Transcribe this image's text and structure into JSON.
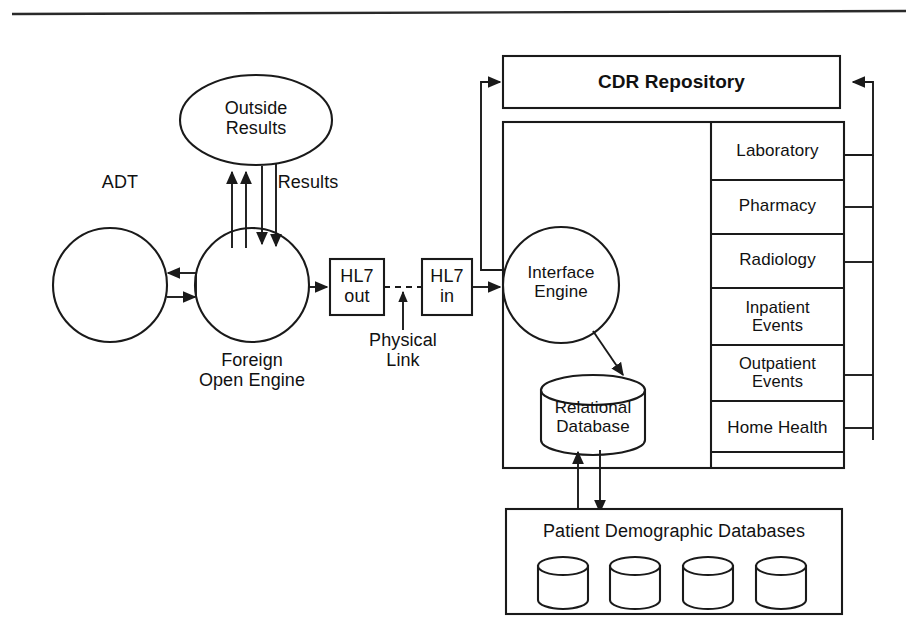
{
  "diagram": {
    "top_rule": "horizontal-rule"
  },
  "left_section": {
    "adt_label": "ADT",
    "results_label": "Results",
    "outside_results": "Outside\nResults",
    "foreign_open_engine": "Foreign\nOpen Engine",
    "source_circle": "",
    "engine_circle": ""
  },
  "link_section": {
    "hl7_out": "HL7\nout",
    "hl7_in": "HL7\nin",
    "physical_link": "Physical\nLink"
  },
  "cdr": {
    "repository_title": "CDR Repository",
    "interface_engine": "Interface\nEngine",
    "relational_database": "Relational\nDatabase",
    "departments": [
      {
        "label": "Laboratory",
        "has_rail_connector": true
      },
      {
        "label": "Pharmacy",
        "has_rail_connector": true
      },
      {
        "label": "Radiology",
        "has_rail_connector": true
      },
      {
        "label": "Inpatient\nEvents",
        "has_rail_connector": false
      },
      {
        "label": "Outpatient\nEvents",
        "has_rail_connector": true
      },
      {
        "label": "Home Health",
        "has_rail_connector": true
      }
    ]
  },
  "bottom": {
    "patient_demographic_databases": "Patient Demographic Databases",
    "cylinder_count": 4
  },
  "colors": {
    "stroke": "#1a1a1a",
    "background": "#ffffff",
    "text": "#111111"
  }
}
